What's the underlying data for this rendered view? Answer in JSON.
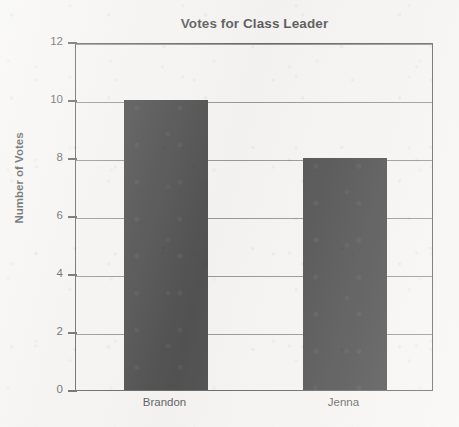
{
  "chart_data": {
    "type": "bar",
    "title": "Votes for Class Leader",
    "categories": [
      "Brandon",
      "Jenna"
    ],
    "values": [
      10,
      8
    ],
    "xlabel": "",
    "ylabel": "Number of Votes",
    "ylim": [
      0,
      12
    ],
    "ytick_labels": [
      "0",
      "2",
      "4",
      "6",
      "8",
      "10",
      "12"
    ],
    "ytick_values": [
      0,
      2,
      4,
      6,
      8,
      10,
      12
    ],
    "grid": true,
    "legend": false,
    "bar_color": "#0a0a0b",
    "axis_color": "#2c2e30",
    "grid_color": "#6d7073",
    "background_color": "#f5f4f2",
    "text_color": "#17181a"
  }
}
